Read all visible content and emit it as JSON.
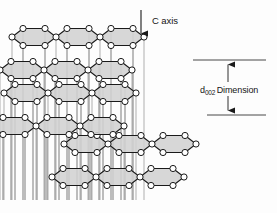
{
  "figure": {
    "background_color": "#fdfdfd",
    "line_color": "#1a1a1a",
    "plane_fill_color": "#d2d2d2",
    "atom_fill_color": "#ffffff",
    "atom_stroke_color": "#1a1a1a",
    "pillar_color": "#8a8a8a"
  },
  "annotations": {
    "c_axis": {
      "label": "C axis",
      "arrow_direction": "down",
      "arrow_x": 141,
      "arrow_y_top": 10,
      "arrow_y_bottom": 40
    },
    "d002": {
      "symbol": "d",
      "subscript": "002",
      "label": "Dimension",
      "full_text": "d002 Dimension",
      "arrow_direction": "double-vertical",
      "top_line_y": 60,
      "bottom_line_y": 115
    }
  },
  "layers": [
    {
      "name": "top-layer",
      "index": 0,
      "origin_x": 22,
      "origin_y": 48,
      "hex_rows": 2,
      "hex_cols": 3
    },
    {
      "name": "middle-layer",
      "index": 1,
      "origin_x": 14,
      "origin_y": 104,
      "hex_rows": 2,
      "hex_cols": 3
    },
    {
      "name": "bottom-layer",
      "index": 2,
      "origin_x": 74,
      "origin_y": 155,
      "hex_rows": 2,
      "hex_cols": 3
    }
  ],
  "geometry": {
    "hex_width": 44,
    "hex_height": 17,
    "row_step_x": 22,
    "row_step_y": 22,
    "skew_dx": 12,
    "skew_dy": -11,
    "atom_radius": 3.1
  }
}
